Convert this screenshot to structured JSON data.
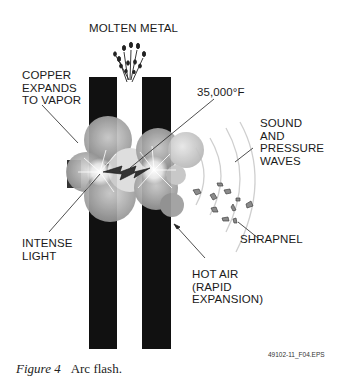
{
  "figure": {
    "labels": {
      "molten_metal": "MOLTEN METAL",
      "copper_vapor": "COPPER\nEXPANDS\nTO VAPOR",
      "temperature": "35,000°F",
      "sound_waves": "SOUND\nAND\nPRESSURE\nWAVES",
      "intense_light": "INTENSE\nLIGHT",
      "shrapnel": "SHRAPNEL",
      "hot_air": "HOT AIR\n(RAPID\nEXPANSION)"
    },
    "file_id": "49102-11_F04.EPS",
    "caption_number": "Figure 4",
    "caption_text": "Arc flash.",
    "colors": {
      "bus_bar": "#111111",
      "cloud_dark": "#8a8a8a",
      "cloud_light": "#cfcfcf",
      "arc": "#2a2a2a",
      "wave": "#c8c8c8"
    }
  }
}
